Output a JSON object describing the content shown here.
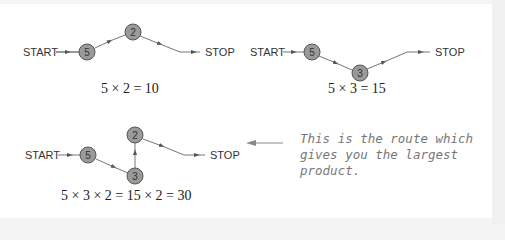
{
  "diagrams": [
    {
      "start_label": "START",
      "stop_label": "STOP",
      "nodes": [
        "5",
        "2"
      ],
      "equation": "5 × 2 = 10"
    },
    {
      "start_label": "START",
      "stop_label": "STOP",
      "nodes": [
        "5",
        "3"
      ],
      "equation": "5 × 3 = 15"
    },
    {
      "start_label": "START",
      "stop_label": "STOP",
      "nodes": [
        "5",
        "3",
        "2"
      ],
      "equation": "5 × 3 × 2 = 15 × 2 = 30"
    }
  ],
  "annotation": {
    "text": "This is the route which gives you the largest product."
  },
  "colors": {
    "node_fill": "#9a9a9a",
    "edge": "#777777",
    "annotation_text": "#777777"
  }
}
